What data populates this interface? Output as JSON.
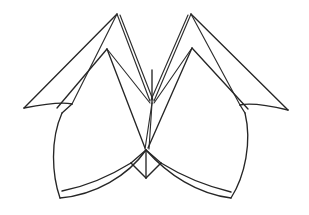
{
  "figure": {
    "title": "Folded paper form line drawing",
    "kind": "line-drawing",
    "background_color": "#ffffff",
    "ink_color": "#262626",
    "canvas": {
      "width": 309,
      "height": 215
    },
    "stroke_width": 1.35,
    "symmetry": "bilateral-vertical",
    "center_x": 152
  },
  "geometry": {
    "points": {
      "left_apex": {
        "x": 117,
        "y": 14
      },
      "right_apex": {
        "x": 191,
        "y": 14
      },
      "left_inner_peak": {
        "x": 107,
        "y": 49
      },
      "right_inner_peak": {
        "x": 192,
        "y": 48
      },
      "left_wing_tip": {
        "x": 24,
        "y": 108
      },
      "right_wing_tip": {
        "x": 288,
        "y": 110
      },
      "center_upper_node": {
        "x": 152,
        "y": 103
      },
      "center_notch_top": {
        "x": 152,
        "y": 70
      },
      "center_lower_node": {
        "x": 146,
        "y": 150
      },
      "center_lower_tip": {
        "x": 146,
        "y": 178
      },
      "left_lobe_shoulder": {
        "x": 62,
        "y": 113
      },
      "right_lobe_shoulder": {
        "x": 245,
        "y": 113
      },
      "left_lobe_foot": {
        "x": 60,
        "y": 198
      },
      "right_lobe_foot": {
        "x": 231,
        "y": 198
      }
    },
    "paths": {
      "left_wing_upper": "M 117 14 L 24 108",
      "left_wing_lower_curve": "M 24 108 Q 60 101 72 104",
      "left_wing_fold_inner": "M 117 14 L 72 104",
      "left_apex_to_center": "M 117 14 L 150 101",
      "left_apex_to_center_b": "M 120 15 L 153 100",
      "left_inner_peak_left": "M 107 49 L 57 108",
      "left_inner_peak_right": "M 107 49 L 150 103",
      "left_inner_peak_fold": "M 107 49 L 145 148",
      "right_wing_upper": "M 191 14 L 288 110",
      "right_wing_lower_curve": "M 288 110 Q 254 102 240 105",
      "right_wing_fold_inner": "M 191 14 L 240 105",
      "right_apex_to_center": "M 191 14 L 154 101",
      "right_apex_to_center_b": "M 188 15 L 151 100",
      "right_inner_peak_left": "M 192 48 L 154 103",
      "right_inner_peak_right": "M 192 48 L 248 109",
      "right_inner_peak_fold": "M 192 48 L 148 148",
      "center_vertical_upper": "M 152 70 L 152 103",
      "center_vertical_lower": "M 146 150 L 146 178",
      "center_spread_left": "M 152 103 L 145 149",
      "center_spread_right": "M 152 103 L 149 149",
      "left_lobe_outer": "M 62 113 C 50 140 52 175 60 198",
      "left_lobe_bottom": "M 60 198 C 95 195 128 176 146 150",
      "right_lobe_outer": "M 245 113 C 252 142 245 176 231 198",
      "right_lobe_bottom": "M 231 198 C 198 194 168 175 146 150",
      "left_lobe_top_join": "M 62 113 L 72 104",
      "right_lobe_top_join": "M 245 113 L 240 105",
      "left_notch_arm": "M 146 150 L 131 163",
      "left_notch_arm_out": "M 131 163 C 110 176 88 186 62 191",
      "right_notch_arm": "M 146 150 L 161 163",
      "right_notch_arm_out": "M 161 163 C 182 176 206 186 231 192",
      "left_notch_diag": "M 131 163 L 146 178",
      "right_notch_diag": "M 161 163 L 146 178"
    }
  }
}
